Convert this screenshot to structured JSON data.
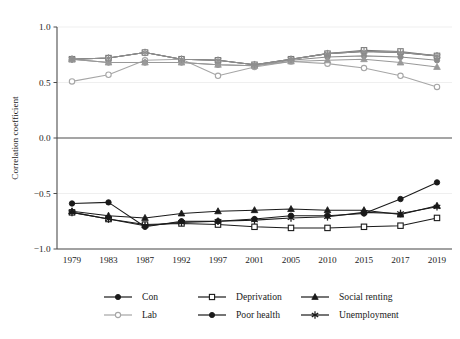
{
  "chart_data": {
    "type": "line",
    "title": "",
    "xlabel": "",
    "ylabel": "Correlation coefficient",
    "categories": [
      "1979",
      "1983",
      "1987",
      "1992",
      "1997",
      "2001",
      "2005",
      "2010",
      "2015",
      "2017",
      "2019"
    ],
    "ylim": [
      -1.0,
      1.0
    ],
    "yticks": [
      "1.0",
      "0.5",
      "0.0",
      "-0.5",
      "-1.0"
    ],
    "ytick_values": [
      1.0,
      0.5,
      0.0,
      -0.5,
      -1.0
    ],
    "grid": "horizontal-light",
    "legend_position": "bottom",
    "zero_line": 0.0,
    "series": [
      {
        "name": "Con",
        "marker": "circle-filled",
        "color": "#4d4d4d",
        "values": [
          0.71,
          0.72,
          0.77,
          0.71,
          0.7,
          0.66,
          0.71,
          0.76,
          0.78,
          0.77,
          0.74
        ]
      },
      {
        "name": "Lab",
        "marker": "circle-open",
        "color": "#a6a6a6",
        "values": [
          0.51,
          0.57,
          0.7,
          0.71,
          0.56,
          0.64,
          0.69,
          0.67,
          0.63,
          0.56,
          0.46
        ]
      },
      {
        "name": "Deprivation",
        "marker": "square-open",
        "color": "#7a7a7a",
        "values": [
          0.71,
          0.72,
          0.77,
          0.71,
          0.7,
          0.66,
          0.71,
          0.76,
          0.79,
          0.78,
          0.74
        ]
      },
      {
        "name": "Poor health",
        "marker": "circle-filled",
        "color": "#8c8c8c",
        "values": [
          0.71,
          0.68,
          0.68,
          0.68,
          0.66,
          0.65,
          0.7,
          0.73,
          0.74,
          0.73,
          0.7
        ]
      },
      {
        "name": "Social renting",
        "marker": "triangle-filled",
        "color": "#999999",
        "values": [
          0.71,
          0.68,
          0.68,
          0.68,
          0.66,
          0.65,
          0.69,
          0.7,
          0.71,
          0.68,
          0.64
        ]
      },
      {
        "name": "Unemployment",
        "marker": "star",
        "color": "#8f8f8f",
        "values": [
          0.71,
          0.72,
          0.77,
          0.71,
          0.7,
          0.66,
          0.71,
          0.76,
          0.78,
          0.77,
          0.74
        ]
      },
      {
        "name": "Deprivation (negative)",
        "marker": "square-open",
        "color": "#1a1a1a",
        "values": [
          -0.67,
          -0.73,
          -0.78,
          -0.77,
          -0.78,
          -0.8,
          -0.81,
          -0.81,
          -0.8,
          -0.79,
          -0.72
        ]
      },
      {
        "name": "Poor health (negative)",
        "marker": "circle-filled",
        "color": "#1a1a1a",
        "values": [
          -0.59,
          -0.58,
          -0.8,
          -0.75,
          -0.75,
          -0.73,
          -0.7,
          -0.7,
          -0.68,
          -0.55,
          -0.4
        ]
      },
      {
        "name": "Social renting (negative)",
        "marker": "triangle-filled",
        "color": "#1a1a1a",
        "values": [
          -0.66,
          -0.7,
          -0.72,
          -0.68,
          -0.66,
          -0.65,
          -0.64,
          -0.65,
          -0.65,
          -0.69,
          -0.61
        ]
      },
      {
        "name": "Unemployment (negative)",
        "marker": "star",
        "color": "#1a1a1a",
        "values": [
          -0.67,
          -0.73,
          -0.79,
          -0.76,
          -0.75,
          -0.74,
          -0.72,
          -0.71,
          -0.67,
          -0.68,
          -0.62
        ]
      }
    ]
  },
  "legend": {
    "entries": [
      {
        "label": "Con",
        "marker": "circle-filled",
        "color": "#1a1a1a"
      },
      {
        "label": "Deprivation",
        "marker": "square-open",
        "color": "#1a1a1a"
      },
      {
        "label": "Social renting",
        "marker": "triangle-filled",
        "color": "#1a1a1a"
      },
      {
        "label": "Lab",
        "marker": "circle-open",
        "color": "#a6a6a6"
      },
      {
        "label": "Poor health",
        "marker": "circle-filled",
        "color": "#1a1a1a"
      },
      {
        "label": "Unemployment",
        "marker": "star",
        "color": "#1a1a1a"
      }
    ]
  }
}
